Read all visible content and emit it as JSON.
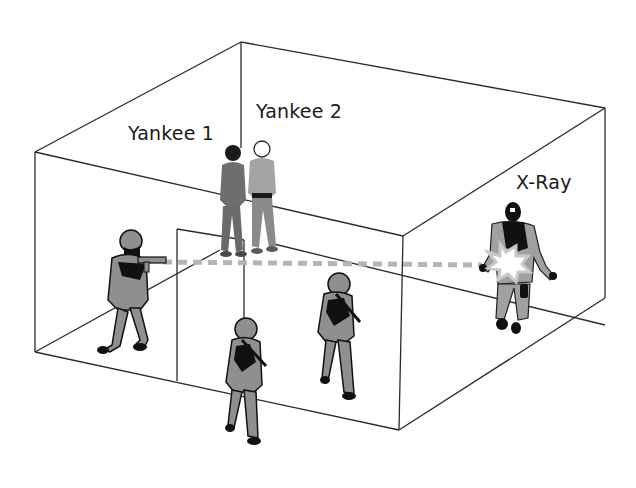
{
  "diagram": {
    "type": "room-entry-scenario",
    "labels": {
      "yankee1": "Yankee 1",
      "yankee2": "Yankee 2",
      "xray": "X-Ray"
    },
    "figures": [
      {
        "id": "officer-left",
        "role": "armed officer aiming rifle",
        "color": "#8c8c8c"
      },
      {
        "id": "officer-center-front",
        "role": "armed officer walking",
        "color": "#8c8c8c"
      },
      {
        "id": "officer-center-back",
        "role": "armed officer walking",
        "color": "#8c8c8c"
      },
      {
        "id": "yankee-1",
        "role": "civilian bystander",
        "color": "#7a7a7a"
      },
      {
        "id": "yankee-2",
        "role": "civilian bystander",
        "color": "#9a9a9a"
      },
      {
        "id": "x-ray",
        "role": "masked suspect hit by shot",
        "color": "#a0a0a0"
      }
    ],
    "sight_line": {
      "style": "dashed",
      "color": "#b5b5b5"
    },
    "colors": {
      "line": "#2b2b2b",
      "uniform": "#8f8f8f",
      "shadow": "#111111",
      "civilian_dark": "#6e6e6e",
      "civilian_light": "#a3a3a3",
      "flash": "#ffffff"
    }
  }
}
